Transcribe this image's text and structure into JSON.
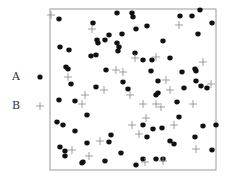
{
  "chart_data": {
    "type": "scatter",
    "title": "",
    "xlabel": "",
    "ylabel": "",
    "frame": {
      "left": 50,
      "top": 9,
      "right": 216,
      "bottom": 170
    },
    "legend": [
      {
        "label": "A",
        "marker": "dot",
        "color": "#111111"
      },
      {
        "label": "B",
        "marker": "cross",
        "color": "#888888"
      }
    ],
    "series": [
      {
        "name": "A",
        "marker": "dot",
        "points": [
          [
            59,
            19
          ],
          [
            117,
            13
          ],
          [
            132,
            13
          ],
          [
            133,
            17
          ],
          [
            180,
            16
          ],
          [
            192,
            16
          ],
          [
            200,
            10
          ],
          [
            212,
            23
          ],
          [
            93,
            23
          ],
          [
            147,
            26
          ],
          [
            136,
            29
          ],
          [
            198,
            34
          ],
          [
            122,
            34
          ],
          [
            109,
            35
          ],
          [
            97,
            40
          ],
          [
            98,
            43
          ],
          [
            105,
            40
          ],
          [
            163,
            41
          ],
          [
            117,
            43
          ],
          [
            119,
            47
          ],
          [
            118,
            51
          ],
          [
            60,
            47
          ],
          [
            69,
            50
          ],
          [
            135,
            53
          ],
          [
            91,
            56
          ],
          [
            96,
            55
          ],
          [
            143,
            60
          ],
          [
            152,
            60
          ],
          [
            170,
            58
          ],
          [
            66,
            67
          ],
          [
            68,
            69
          ],
          [
            106,
            70
          ],
          [
            151,
            71
          ],
          [
            182,
            72
          ],
          [
            195,
            69
          ],
          [
            196,
            71
          ],
          [
            71,
            84
          ],
          [
            96,
            87
          ],
          [
            123,
            82
          ],
          [
            128,
            89
          ],
          [
            158,
            81
          ],
          [
            196,
            81
          ],
          [
            184,
            88
          ],
          [
            201,
            86
          ],
          [
            207,
            88
          ],
          [
            156,
            95
          ],
          [
            158,
            93
          ],
          [
            59,
            100
          ],
          [
            75,
            101
          ],
          [
            177,
            102
          ],
          [
            87,
            115
          ],
          [
            179,
            117
          ],
          [
            57,
            122
          ],
          [
            63,
            125
          ],
          [
            143,
            125
          ],
          [
            153,
            129
          ],
          [
            162,
            128
          ],
          [
            203,
            126
          ],
          [
            216,
            125
          ],
          [
            75,
            131
          ],
          [
            111,
            135
          ],
          [
            147,
            137
          ],
          [
            195,
            137
          ],
          [
            60,
            147
          ],
          [
            87,
            143
          ],
          [
            109,
            142
          ],
          [
            170,
            141
          ],
          [
            174,
            144
          ],
          [
            65,
            151
          ],
          [
            65,
            156
          ],
          [
            121,
            153
          ],
          [
            212,
            150
          ],
          [
            82,
            163
          ],
          [
            83,
            162
          ],
          [
            105,
            161
          ],
          [
            136,
            165
          ],
          [
            143,
            159
          ],
          [
            156,
            159
          ],
          [
            163,
            159
          ]
        ]
      },
      {
        "name": "B",
        "marker": "cross",
        "points": [
          [
            51,
            15
          ],
          [
            92,
            29
          ],
          [
            179,
            25
          ],
          [
            135,
            58
          ],
          [
            156,
            57
          ],
          [
            203,
            62
          ],
          [
            116,
            70
          ],
          [
            123,
            72
          ],
          [
            68,
            77
          ],
          [
            166,
            80
          ],
          [
            211,
            84
          ],
          [
            104,
            90
          ],
          [
            170,
            90
          ],
          [
            85,
            95
          ],
          [
            130,
            95
          ],
          [
            82,
            104
          ],
          [
            143,
            104
          ],
          [
            156,
            104
          ],
          [
            161,
            107
          ],
          [
            193,
            104
          ],
          [
            146,
            118
          ],
          [
            132,
            125
          ],
          [
            174,
            125
          ],
          [
            139,
            134
          ],
          [
            100,
            141
          ],
          [
            72,
            150
          ],
          [
            89,
            156
          ],
          [
            196,
            149
          ],
          [
            145,
            162
          ],
          [
            163,
            161
          ]
        ]
      }
    ]
  }
}
